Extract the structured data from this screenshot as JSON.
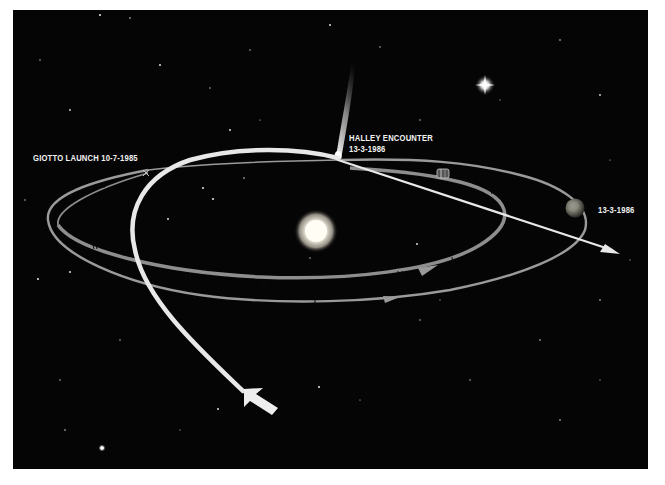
{
  "diagram": {
    "labels": {
      "launch": "GIOTTO LAUNCH  10-7-1985",
      "encounter_line1": "HALLEY ENCOUNTER",
      "encounter_line2": "13-3-1986",
      "earth_date": "13-3-1986"
    },
    "objects": {
      "sun": "sun",
      "comet": "halley-comet",
      "earth": "earth",
      "spacecraft": "giotto-spacecraft",
      "bright_star": "bright-star"
    },
    "colors": {
      "background": "#050505",
      "border": "#ffffff",
      "trajectory": "#e8e8e8",
      "orbit": "#9a9a9a",
      "text": "#f2f2f2",
      "sun": "#fffbe8"
    }
  }
}
